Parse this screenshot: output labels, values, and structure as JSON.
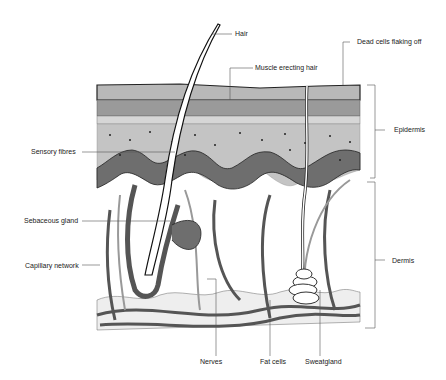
{
  "diagram": {
    "labels": {
      "hair": "Hair",
      "muscle": "Muscle erecting hair",
      "dead_cells": "Dead cells flaking off",
      "epidermis": "Epidermis",
      "sensory": "Sensory fibres",
      "sebaceous": "Sebaceous gland",
      "capillary": "Capillary network",
      "dermis": "Dermis",
      "nerves": "Nerves",
      "fat": "Fat cells",
      "sweat": "Sweatgland"
    },
    "colors": {
      "stratum_top": "#b8b8b8",
      "stratum_mid": "#9a9a9a",
      "cell_row": "#d6d6d6",
      "spinous": "#c4c4c4",
      "basal": "#6e6e6e",
      "vessel": "#555555",
      "fat": "#eeeeee",
      "line": "#333333"
    }
  }
}
